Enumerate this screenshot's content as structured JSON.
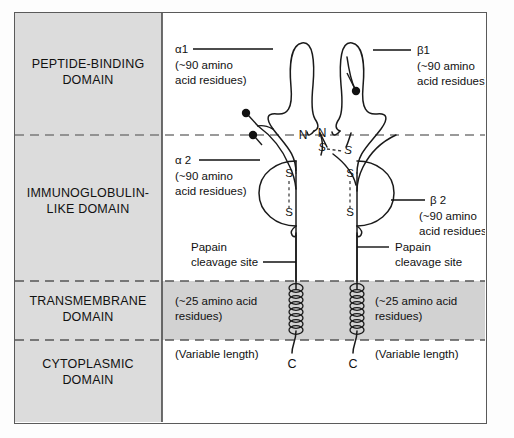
{
  "figure": {
    "frame_color": "#5a5a5a",
    "panel_fill": "#dcdcdc",
    "membrane_fill": "#d2d2d2",
    "line_color": "#1a1a1a"
  },
  "domains": [
    {
      "id": "peptide-binding",
      "line1": "PEPTIDE-BINDING",
      "line2": "DOMAIN"
    },
    {
      "id": "immunoglobulin-like",
      "line1": "IMMUNOGLOBULIN-",
      "line2": "LIKE DOMAIN"
    },
    {
      "id": "transmembrane",
      "line1": "TRANSMEMBRANE",
      "line2": "DOMAIN"
    },
    {
      "id": "cytoplasmic",
      "line1": "CYTOPLASMIC",
      "line2": "DOMAIN"
    }
  ],
  "chains": {
    "alpha1": {
      "name": "α1",
      "size_line1": "(~90 amino",
      "size_line2": "acid residues)"
    },
    "alpha2": {
      "name": "α 2",
      "size_line1": "(~90 amino",
      "size_line2": "acid residues)"
    },
    "beta1": {
      "name": "β1",
      "size_line1": "(~90 amino",
      "size_line2": "acid residues)"
    },
    "beta2": {
      "name": "β 2",
      "size_line1": "(~90 amino",
      "size_line2": "acid residues)"
    }
  },
  "annotations": {
    "n_terminus_alpha": "N",
    "n_terminus_beta": "N",
    "c_terminus_alpha": "C",
    "c_terminus_beta": "C",
    "disulfide_s": "S",
    "papain_left_line1": "Papain",
    "papain_left_line2": "cleavage site",
    "papain_right_line1": "Papain",
    "papain_right_line2": "cleavage site",
    "tm_left_line1": "(~25 amino acid",
    "tm_left_line2": "residues)",
    "tm_right_line1": "(~25 amino acid",
    "tm_right_line2": "residues)",
    "variable_left": "(Variable length)",
    "variable_right": "(Variable length)"
  }
}
